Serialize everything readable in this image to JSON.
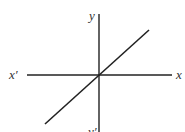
{
  "diagram": {
    "type": "coordinate-axes-with-line",
    "colors": {
      "background": "#ffffff",
      "stroke": "#222222",
      "label": "#333333"
    },
    "axes": {
      "horizontal": {
        "label_positive": "x",
        "label_negative": "x′"
      },
      "vertical": {
        "label_positive": "y",
        "label_negative": "y′"
      }
    },
    "line": {
      "equation": "y = x",
      "passes_through_origin": true,
      "slope": "positive"
    }
  }
}
